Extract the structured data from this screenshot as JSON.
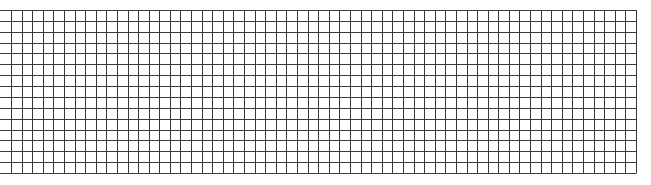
{
  "grid": {
    "rows": 15,
    "cols": 59,
    "x_start": 11,
    "x_end": 636,
    "h_line_x_start": 0,
    "y_start": 10,
    "y_end": 173,
    "line_color": "#3a3a3a",
    "line_width": 1,
    "background": "#ffffff"
  }
}
